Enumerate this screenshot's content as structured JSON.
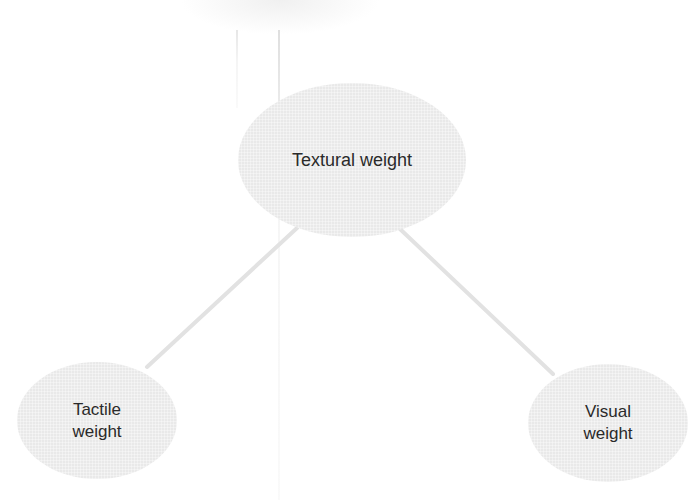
{
  "diagram": {
    "type": "tree",
    "root": {
      "id": "textural",
      "label": "Textural weight"
    },
    "children": [
      {
        "id": "tactile",
        "label_lines": [
          "Tactile",
          "weight"
        ]
      },
      {
        "id": "visual",
        "label_lines": [
          "Visual",
          "weight"
        ]
      }
    ],
    "edges": [
      {
        "from": "textural",
        "to": "tactile"
      },
      {
        "from": "textural",
        "to": "visual"
      }
    ],
    "colors": {
      "node_fill": "#e9e9e9",
      "edge": "#e3e3e3",
      "text": "#2a2a2a",
      "background": "#ffffff"
    }
  }
}
